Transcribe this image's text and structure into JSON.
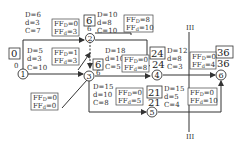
{
  "nodes": [
    {
      "id": "1",
      "label": "1",
      "es": "0",
      "lf": "0"
    },
    {
      "id": "2",
      "label": "2",
      "es": "6",
      "lf": "6"
    },
    {
      "id": "3",
      "label": "3",
      "es": "6",
      "lf": "6"
    },
    {
      "id": "4",
      "label": "4",
      "es": "24",
      "lf": "24"
    },
    {
      "id": "5",
      "label": "5",
      "es": "21",
      "lf": "21"
    },
    {
      "id": "6",
      "label": "6",
      "es": "36",
      "lf": "36"
    }
  ],
  "activities": {
    "a12": {
      "D": "D=6",
      "d": "d=3",
      "C": "C=7",
      "FFD": "FF",
      "FFD_sub": "D",
      "FFD_val": "=0",
      "FFd_sub": "d",
      "FFd_val": "=3"
    },
    "a13": {
      "D": "D=5",
      "d": "d=3",
      "C": "C=10",
      "FFD_sub": "D",
      "FFD_val": "=1",
      "FFd_sub": "d",
      "FFd_val": "=3"
    },
    "a13b": {
      "FFD_sub": "D",
      "FFD_val": "=0",
      "FFd_sub": "d",
      "FFd_val": "=0"
    },
    "a24": {
      "D": "D=10",
      "d": "d=8",
      "C": "C=10",
      "FFD_sub": "D",
      "FFD_val": "=8",
      "FFd_sub": "d",
      "FFd_val": "=10"
    },
    "a34": {
      "D": "D=18",
      "d": "d=10",
      "C": "C=5",
      "FFD_sub": "D",
      "FFD_val": "=0",
      "FFd_sub": "d",
      "FFd_val": "=8"
    },
    "a35": {
      "D": "D=15",
      "d": "d=10",
      "C": "C=8",
      "FFD_sub": "D",
      "FFD_val": "=0",
      "FFd_sub": "d",
      "FFd_val": "=5"
    },
    "a46": {
      "D": "D=12",
      "d": "d=8",
      "C": "C=3",
      "FFD_sub": "D",
      "FFD_val": "=0",
      "FFd_sub": "d",
      "FFd_val": "=4"
    },
    "a56": {
      "D": "D=15",
      "d": "d=5",
      "C": "C=4",
      "FFD_sub": "D",
      "FFD_val": "=0",
      "FFd_sub": "d",
      "FFd_val": "=10"
    }
  },
  "ff_prefix": "FF",
  "cut_label_top": "III",
  "cut_label_bottom": "III"
}
